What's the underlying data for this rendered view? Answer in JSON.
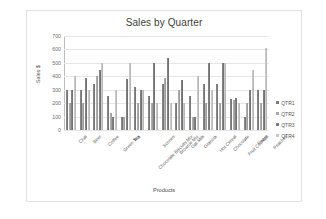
{
  "chart_data": {
    "type": "bar",
    "title": "Sales by Quarter",
    "xlabel": "Products",
    "ylabel": "Sales $",
    "ylim": [
      0,
      700
    ],
    "yticks": [
      0,
      100,
      200,
      300,
      400,
      500,
      600,
      700
    ],
    "grid": true,
    "legend_position": "right",
    "categories": [
      "Chai",
      "Beer",
      "Coffee",
      "Green Tea",
      "Tea",
      "Chocolate Biscuits Mix",
      "Scones",
      "Brownie Mix",
      "Oat Milk",
      "Granola",
      "Hot Cereal",
      "Chocolate",
      "Fruit Cocktail",
      "Pears",
      "Peaches"
    ],
    "series": [
      {
        "name": "QTR1",
        "color": "#7a7a7a",
        "values": [
          300,
          300,
          340,
          250,
          100,
          320,
          250,
          340,
          200,
          250,
          340,
          340,
          230,
          100,
          300
        ]
      },
      {
        "name": "QTR2",
        "color": "#a8a8a8",
        "values": [
          200,
          200,
          400,
          130,
          100,
          200,
          200,
          390,
          300,
          100,
          200,
          200,
          220,
          200,
          200
        ]
      },
      {
        "name": "QTR3",
        "color": "#7a7a7a",
        "values": [
          300,
          390,
          450,
          100,
          380,
          300,
          500,
          540,
          370,
          100,
          500,
          500,
          240,
          300,
          300
        ]
      },
      {
        "name": "QTR4",
        "color": "#c6c6c6",
        "values": [
          400,
          300,
          500,
          300,
          500,
          300,
          200,
          200,
          200,
          400,
          300,
          500,
          200,
          450,
          610
        ]
      }
    ]
  },
  "legend": {
    "items": [
      {
        "label": "QTR1"
      },
      {
        "label": "QTR2"
      },
      {
        "label": "QTR3"
      },
      {
        "label": "QTR4"
      }
    ]
  }
}
